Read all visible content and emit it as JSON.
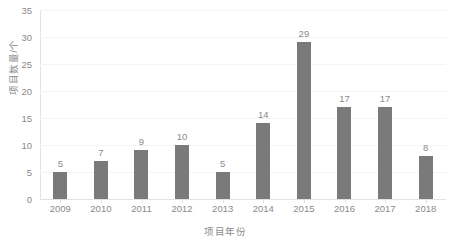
{
  "chart_data": {
    "type": "bar",
    "title": "",
    "subtitle": "",
    "xlabel": "项目年份",
    "ylabel": "项目数量/个",
    "categories": [
      "2009",
      "2010",
      "2011",
      "2012",
      "2013",
      "2014",
      "2015",
      "2016",
      "2017",
      "2018"
    ],
    "values": [
      5,
      7,
      9,
      10,
      5,
      14,
      29,
      17,
      17,
      8
    ],
    "data_labels": [
      "5",
      "7",
      "9",
      "10",
      "5",
      "14",
      "29",
      "17",
      "17",
      "8"
    ],
    "ylim": [
      0,
      35
    ],
    "ytick_step": 5,
    "yticks": [
      "0",
      "5",
      "10",
      "15",
      "20",
      "25",
      "30",
      "35"
    ],
    "grid": "horizontal-faint",
    "legend": "none",
    "series": [
      {
        "name": "项目数量",
        "values": [
          5,
          7,
          9,
          10,
          5,
          14,
          29,
          17,
          17,
          8
        ],
        "color": "#7a7a7a"
      }
    ],
    "colors": {
      "bar": "#7a7a7a",
      "text": "#8a8a8a",
      "axis": "#e2e2e2",
      "grid": "#f4f4f4",
      "background": "#ffffff"
    }
  }
}
